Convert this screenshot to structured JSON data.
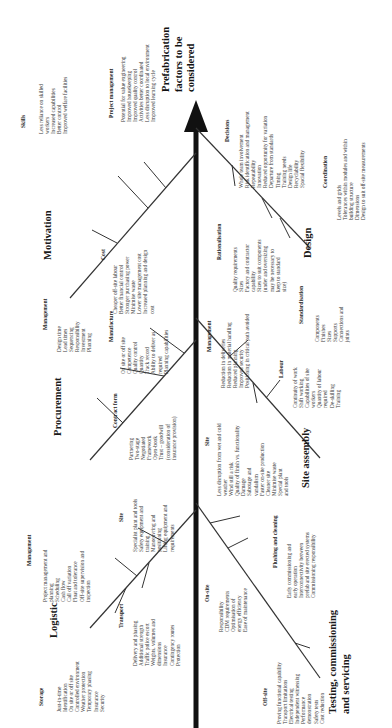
{
  "goal": {
    "lines": [
      "Prefabrication",
      "factors to be",
      "considered"
    ]
  },
  "categories": {
    "motivation": {
      "title": "Motivation",
      "subcauses": {
        "skills": {
          "title": "Skills",
          "items": [
            "Less reliance on skilled",
            "workers",
            "Increased capabilities",
            "Better control",
            "Improved welfare facilities"
          ]
        },
        "project_management": {
          "title": "Project management",
          "items": [
            "Potential for value engineering",
            "Improved housekeeping",
            "Improved quality control",
            "Activities better coordinated",
            "Less disruption to local environment",
            "Improved learning cycle"
          ]
        },
        "cost": {
          "title": "Cost",
          "items": [
            "Cheaper off-site labour",
            "Better financial control",
            "Stronger purchasing power",
            "Minimise waste",
            "Lower site management cost",
            "Increased planning and design",
            "cost"
          ]
        }
      }
    },
    "procurement": {
      "title": "Procurement",
      "subcauses": {
        "management": {
          "title": "Management",
          "items": [
            "Design time",
            "Lead times",
            "Sequencing",
            "Responsibility",
            "Investment",
            "Planning"
          ]
        },
        "manufacture": {
          "title": "Manufacture",
          "items": [
            "On site or off site",
            "Competence",
            "Quality control",
            "Quantity",
            "Track record",
            "Ability to deliver as",
            "required",
            "Planning capabilities"
          ]
        },
        "contract_form": {
          "title": "Contract form",
          "items": [
            "Partnering",
            "Two-stage",
            "Negotiated",
            "Framework",
            "Open-book",
            "Trust – goodwill",
            "(consideration of",
            "insurance provision)"
          ]
        }
      }
    },
    "logistic": {
      "title": "Logistic",
      "subcauses": {
        "storage": {
          "title": "Storage",
          "items": [
            "Just-in-time",
            "Identification",
            "On site or off site",
            "Controlled environment",
            "Weather protection",
            "Temporary phasing",
            "Insurance",
            "Security"
          ]
        },
        "management": {
          "title": "Management",
          "items": [
            "Project management and",
            "planning",
            "Scheduling",
            "Cash flow",
            "Call off variation",
            "Float and tolerance",
            "Off-site supervision and",
            "inspection"
          ]
        },
        "transport": {
          "title": "Transport",
          "items": [
            "Delivery and phasing",
            "Additional strength",
            "Traffic police escort",
            "Weights, volumes and",
            "dimensions",
            "Insurance",
            "Contingency routes",
            "Protection"
          ]
        },
        "site": {
          "title": "Site",
          "items": [
            "Specialist plant and tools",
            "Safety equipment and",
            "training",
            "Manoeuvring and",
            "positioning",
            "Lifting equipment and",
            "requirements"
          ]
        }
      }
    },
    "design": {
      "title": "Design",
      "subcauses": {
        "decisions": {
          "title": "Decisions",
          "items": [
            "Whole team involvement",
            "Risk identification and management",
            "Repeatability",
            "Innovation",
            "Reduced opportunity for variation",
            "Departure from standards",
            "Timing",
            "Training needs",
            "Design life",
            "Recyclability",
            "Spacial flexibility"
          ]
        },
        "rationalisation": {
          "title": "Rationalisation",
          "items": [
            "Quality requirements",
            "Sizes",
            "Factory and contractor",
            "capability",
            "Sizes to suit components",
            "(under and oversizing",
            "may be necessary to",
            "keep to standard",
            "size)"
          ]
        },
        "coordination": {
          "title": "Coordination",
          "items": [
            "Levels and grids",
            "Tolerances within modules and within",
            "building structure",
            "Dimensions",
            "Design to suit off-site measurements"
          ]
        },
        "standardisation": {
          "title": "Standardisation",
          "items": [
            "Components",
            "Finishes",
            "Sizes",
            "Supports",
            "Connections and",
            "joints"
          ]
        }
      }
    },
    "site_assembly": {
      "title": "Site assembly",
      "subcauses": {
        "management": {
          "title": "Management",
          "items": [
            "Reduction in deliveries",
            "Reduction in material handling",
            "Reduced planning",
            "Improved security",
            "Positioning in critical path avoided"
          ]
        },
        "site": {
          "title": "Site",
          "items": [
            "Less disruption from wet and cold",
            "weather",
            "Wind still a risk",
            "Quality of finish vs. functionality",
            "Damage",
            "Sabotage and",
            "vandalism",
            "Faster on-site production",
            "Cleaner site",
            "Minimise waste",
            "Special plant",
            "and tools"
          ]
        },
        "labour": {
          "title": "Labour",
          "items": [
            "Continuity of work",
            "Shift working",
            "Capabilities of site",
            "workers",
            "Quantity of labour",
            "required",
            "De-skilling",
            "Training"
          ]
        }
      }
    },
    "testing": {
      "title": "Testing, commissioning and servicing",
      "title_lines": [
        "Testing, commissioning",
        "and servicing"
      ],
      "subcauses": {
        "on_site": {
          "title": "On-site",
          "items": [
            "Responsibility",
            "CDM requirements",
            "Optimisation of",
            "energy efficiency",
            "Ease of maintenance"
          ]
        },
        "flushing": {
          "title": "Flushing and cleaning",
          "items": [
            "Early commissioning and",
            "early operation",
            "Interconnectivity between",
            "prefab and site erected systems",
            "Commissioning responsibility"
          ]
        },
        "off_site": {
          "title": "Off-site",
          "items": [
            "Proving functional capability",
            "Transport limitations",
            "Electrical testing",
            "Independent witnessing",
            "Performance",
            "demonstration",
            "Safety tests",
            "Cost reduction"
          ]
        }
      }
    }
  }
}
